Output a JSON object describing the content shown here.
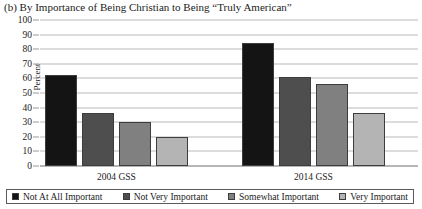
{
  "chart_data": {
    "type": "bar",
    "title": "(b) By Importance of Being Christian to Being “Truly American”",
    "xlabel": "",
    "ylabel": "Percent",
    "categories": [
      "2004 GSS",
      "2014 GSS"
    ],
    "ylim": [
      0,
      100
    ],
    "yticks": [
      0,
      10,
      20,
      30,
      40,
      50,
      60,
      70,
      80,
      90,
      100
    ],
    "grid": true,
    "legend_position": "bottom",
    "series": [
      {
        "name": "Not At All Important",
        "color": "#141414",
        "values": [
          62,
          84
        ]
      },
      {
        "name": "Not Very Important",
        "color": "#4e4e4e",
        "values": [
          36,
          61
        ]
      },
      {
        "name": "Somewhat Important",
        "color": "#808080",
        "values": [
          30,
          56
        ]
      },
      {
        "name": "Very Important",
        "color": "#b4b4b4",
        "values": [
          20,
          36
        ]
      }
    ]
  },
  "legend": {
    "entries": [
      {
        "label": "Not At All Important",
        "color": "#141414"
      },
      {
        "label": "Not Very Important",
        "color": "#4e4e4e"
      },
      {
        "label": "Somewhat Important",
        "color": "#808080"
      },
      {
        "label": "Very Important",
        "color": "#b4b4b4"
      }
    ]
  }
}
